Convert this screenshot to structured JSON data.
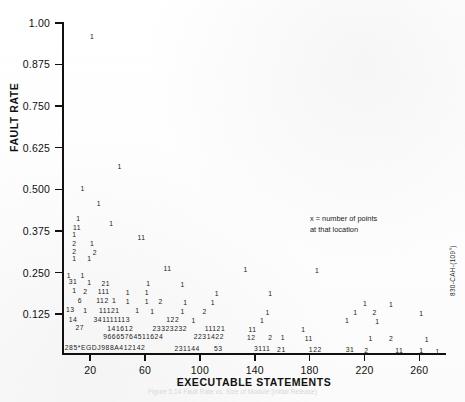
{
  "margin_id": "830-CAH-(109°)",
  "caption": "Figure 5.14  Fault Rate vs. Size of Module (Initial Release)",
  "annotation": {
    "line1": "x = number of points",
    "line2": "at that location"
  },
  "chart_data": {
    "type": "scatter",
    "title": "",
    "xlabel": "EXECUTABLE STATEMENTS",
    "ylabel": "FAULT RATE",
    "xlim": [
      0,
      280
    ],
    "ylim": [
      0.0,
      1.0
    ],
    "grid": false,
    "legend": "none",
    "marker_encoding": "Each plotted glyph is a count of coincident points: digits 1-9 are literal counts; letters A, D, E, G, J represent counts of 10 or more.",
    "xticks": [
      20,
      60,
      100,
      140,
      180,
      220,
      260
    ],
    "yticks": [
      0.125,
      0.25,
      0.375,
      0.5,
      0.625,
      0.75,
      0.875,
      1.0
    ],
    "ytick_labels": [
      "0.125",
      "0.250",
      "0.375",
      "0.500",
      "0.625",
      "0.750",
      "0.875",
      "1.00"
    ],
    "points": [
      {
        "x": 22,
        "y": 0.955,
        "label": "1"
      },
      {
        "x": 42,
        "y": 0.565,
        "label": "1"
      },
      {
        "x": 15,
        "y": 0.497,
        "label": "1"
      },
      {
        "x": 27,
        "y": 0.452,
        "label": "1"
      },
      {
        "x": 12,
        "y": 0.408,
        "label": "1"
      },
      {
        "x": 36,
        "y": 0.392,
        "label": "1"
      },
      {
        "x": 11,
        "y": 0.381,
        "label": "11"
      },
      {
        "x": 9,
        "y": 0.36,
        "label": "1"
      },
      {
        "x": 58,
        "y": 0.352,
        "label": "11"
      },
      {
        "x": 9,
        "y": 0.333,
        "label": "2"
      },
      {
        "x": 22,
        "y": 0.333,
        "label": "1"
      },
      {
        "x": 9,
        "y": 0.31,
        "label": "2"
      },
      {
        "x": 24,
        "y": 0.305,
        "label": "2"
      },
      {
        "x": 9,
        "y": 0.288,
        "label": "1"
      },
      {
        "x": 20,
        "y": 0.287,
        "label": "1"
      },
      {
        "x": 77,
        "y": 0.258,
        "label": "11"
      },
      {
        "x": 134,
        "y": 0.255,
        "label": "1"
      },
      {
        "x": 186,
        "y": 0.252,
        "label": "1"
      },
      {
        "x": 5,
        "y": 0.238,
        "label": "1"
      },
      {
        "x": 15,
        "y": 0.236,
        "label": "1"
      },
      {
        "x": 8,
        "y": 0.218,
        "label": "31"
      },
      {
        "x": 20,
        "y": 0.216,
        "label": "1"
      },
      {
        "x": 32,
        "y": 0.214,
        "label": "21"
      },
      {
        "x": 63,
        "y": 0.213,
        "label": "1"
      },
      {
        "x": 88,
        "y": 0.21,
        "label": "1"
      },
      {
        "x": 9,
        "y": 0.191,
        "label": "1"
      },
      {
        "x": 17,
        "y": 0.19,
        "label": "2"
      },
      {
        "x": 26,
        "y": 0.189,
        "label": "111"
      },
      {
        "x": 48,
        "y": 0.186,
        "label": "1"
      },
      {
        "x": 62,
        "y": 0.185,
        "label": "1"
      },
      {
        "x": 113,
        "y": 0.183,
        "label": "1"
      },
      {
        "x": 152,
        "y": 0.182,
        "label": "1"
      },
      {
        "x": 13,
        "y": 0.163,
        "label": "6"
      },
      {
        "x": 25,
        "y": 0.162,
        "label": "112"
      },
      {
        "x": 38,
        "y": 0.161,
        "label": "1"
      },
      {
        "x": 48,
        "y": 0.16,
        "label": "1"
      },
      {
        "x": 62,
        "y": 0.159,
        "label": "1"
      },
      {
        "x": 72,
        "y": 0.158,
        "label": "2"
      },
      {
        "x": 90,
        "y": 0.157,
        "label": "1"
      },
      {
        "x": 110,
        "y": 0.156,
        "label": "1"
      },
      {
        "x": 221,
        "y": 0.152,
        "label": "1"
      },
      {
        "x": 240,
        "y": 0.15,
        "label": "1"
      },
      {
        "x": 6,
        "y": 0.134,
        "label": "13"
      },
      {
        "x": 17,
        "y": 0.133,
        "label": "1"
      },
      {
        "x": 27,
        "y": 0.132,
        "label": "11121"
      },
      {
        "x": 55,
        "y": 0.131,
        "label": "1"
      },
      {
        "x": 66,
        "y": 0.13,
        "label": "1"
      },
      {
        "x": 88,
        "y": 0.129,
        "label": "1"
      },
      {
        "x": 104,
        "y": 0.128,
        "label": "2"
      },
      {
        "x": 150,
        "y": 0.127,
        "label": "1"
      },
      {
        "x": 214,
        "y": 0.126,
        "label": "1"
      },
      {
        "x": 228,
        "y": 0.125,
        "label": "2"
      },
      {
        "x": 262,
        "y": 0.124,
        "label": "1"
      },
      {
        "x": 8,
        "y": 0.106,
        "label": "14"
      },
      {
        "x": 23,
        "y": 0.105,
        "label": "341111113"
      },
      {
        "x": 76,
        "y": 0.104,
        "label": "122"
      },
      {
        "x": 96,
        "y": 0.103,
        "label": "1"
      },
      {
        "x": 146,
        "y": 0.102,
        "label": "1"
      },
      {
        "x": 208,
        "y": 0.101,
        "label": "1"
      },
      {
        "x": 230,
        "y": 0.1,
        "label": "1"
      },
      {
        "x": 13,
        "y": 0.08,
        "label": "27"
      },
      {
        "x": 33,
        "y": 0.079,
        "label": "141612"
      },
      {
        "x": 66,
        "y": 0.078,
        "label": "23323232"
      },
      {
        "x": 104,
        "y": 0.077,
        "label": "11121"
      },
      {
        "x": 139,
        "y": 0.076,
        "label": "11"
      },
      {
        "x": 176,
        "y": 0.075,
        "label": "1"
      },
      {
        "x": 30,
        "y": 0.054,
        "label": "96665764511624"
      },
      {
        "x": 96,
        "y": 0.053,
        "label": "2231422"
      },
      {
        "x": 138,
        "y": 0.052,
        "label": "12"
      },
      {
        "x": 152,
        "y": 0.051,
        "label": "2"
      },
      {
        "x": 161,
        "y": 0.05,
        "label": "1"
      },
      {
        "x": 180,
        "y": 0.049,
        "label": "11"
      },
      {
        "x": 225,
        "y": 0.048,
        "label": "1"
      },
      {
        "x": 240,
        "y": 0.047,
        "label": "2"
      },
      {
        "x": 266,
        "y": 0.046,
        "label": "1"
      },
      {
        "x": 2,
        "y": 0.02,
        "label": "285*EGDJ988A412142"
      },
      {
        "x": 82,
        "y": 0.019,
        "label": "231144"
      },
      {
        "x": 114,
        "y": 0.018,
        "label": "53"
      },
      {
        "x": 140,
        "y": 0.017,
        "label": "3111"
      },
      {
        "x": 160,
        "y": 0.016,
        "label": "21"
      },
      {
        "x": 180,
        "y": 0.015,
        "label": "122"
      },
      {
        "x": 210,
        "y": 0.014,
        "label": "31"
      },
      {
        "x": 222,
        "y": 0.013,
        "label": "2"
      },
      {
        "x": 246,
        "y": 0.012,
        "label": "11"
      },
      {
        "x": 262,
        "y": 0.011,
        "label": "1"
      },
      {
        "x": 274,
        "y": 0.01,
        "label": "1"
      }
    ]
  }
}
